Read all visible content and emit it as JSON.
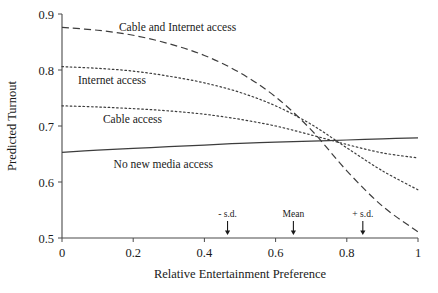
{
  "chart_data": {
    "type": "line",
    "title": "",
    "xlabel": "Relative Entertainment Preference",
    "ylabel": "Predicted Turnout",
    "xlim": [
      0,
      1
    ],
    "ylim": [
      0.5,
      0.9
    ],
    "xticks": [
      "0",
      "0.2",
      "0.4",
      "0.6",
      "0.8",
      "1"
    ],
    "xtick_values": [
      0,
      0.2,
      0.4,
      0.6,
      0.8,
      1
    ],
    "yticks": [
      "0.5",
      "0.6",
      "0.7",
      "0.8",
      "0.9"
    ],
    "ytick_values": [
      0.5,
      0.6,
      0.7,
      0.8,
      0.9
    ],
    "grid": false,
    "legend_position": "inline-labels",
    "x": [
      0,
      0.1,
      0.2,
      0.3,
      0.4,
      0.5,
      0.6,
      0.7,
      0.8,
      0.9,
      1
    ],
    "series": [
      {
        "name": "Cable and Internet access",
        "style": "dashed",
        "label_x": 0.16,
        "label_y": 0.876,
        "values": [
          0.876,
          0.871,
          0.862,
          0.847,
          0.826,
          0.795,
          0.752,
          0.693,
          0.62,
          0.557,
          0.511
        ]
      },
      {
        "name": "Internet access",
        "style": "dotted",
        "label_x": 0.045,
        "label_y": 0.782,
        "values": [
          0.806,
          0.803,
          0.798,
          0.789,
          0.777,
          0.76,
          0.736,
          0.703,
          0.661,
          0.62,
          0.586
        ]
      },
      {
        "name": "Cable access",
        "style": "dotted",
        "label_x": 0.115,
        "label_y": 0.713,
        "values": [
          0.736,
          0.734,
          0.731,
          0.727,
          0.721,
          0.712,
          0.7,
          0.684,
          0.667,
          0.652,
          0.643
        ]
      },
      {
        "name": "No new media access",
        "style": "solid",
        "label_x": 0.145,
        "label_y": 0.632,
        "values": [
          0.653,
          0.657,
          0.66,
          0.663,
          0.666,
          0.669,
          0.671,
          0.673,
          0.675,
          0.677,
          0.679
        ]
      }
    ],
    "annotations": [
      {
        "label": "- s.d.",
        "x": 0.465
      },
      {
        "label": "Mean",
        "x": 0.65
      },
      {
        "label": "+ s.d.",
        "x": 0.845
      }
    ]
  }
}
